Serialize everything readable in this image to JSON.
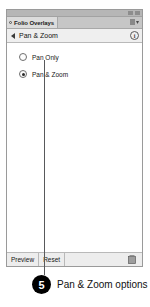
{
  "panel": {
    "window_controls": [
      "minimize",
      "close"
    ],
    "tab": {
      "label": "Folio Overlays",
      "icon": "circle-dot-icon"
    },
    "panel_menu_icon": "panel-menu-icon",
    "breadcrumb": {
      "back_icon": "back-arrow-icon",
      "title": "Pan & Zoom",
      "info_icon": "info-icon",
      "info_glyph": "i"
    },
    "options": [
      {
        "label": "Pan Only",
        "selected": false
      },
      {
        "label": "Pan & Zoom",
        "selected": true
      }
    ],
    "footer": {
      "preview_label": "Preview",
      "reset_label": "Reset",
      "delete_icon": "trash-icon"
    }
  },
  "callout": {
    "number": "5",
    "text": "Pan & Zoom options"
  },
  "colors": {
    "panel_bg": "#f4f4f4",
    "tab_active": "#dcdcdc",
    "badge": "#000000",
    "leader_line": "#58595b"
  }
}
